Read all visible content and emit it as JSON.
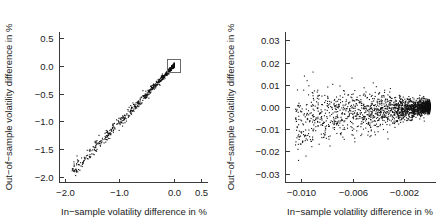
{
  "figure": {
    "background": "#ffffff",
    "point_color": "#111111",
    "axis_color": "#3a3a3a",
    "zoom_box_color": "#6b6b6b"
  },
  "chart_data": [
    {
      "id": "left-panel",
      "type": "scatter",
      "title": "",
      "xlabel": "In-sample volatility difference in %",
      "ylabel": "Out-of-sample volatility difference in %",
      "xlim": [
        -2.1,
        0.62
      ],
      "ylim": [
        -2.1,
        0.62
      ],
      "xticks": [
        -2.0,
        -1.0,
        0.0,
        0.5
      ],
      "xticklabels": [
        "-2.0",
        "-1.0",
        "0.0",
        "0.5"
      ],
      "yticks": [
        -2.0,
        -1.5,
        -1.0,
        -0.5,
        0.0,
        0.5
      ],
      "yticklabels": [
        "-2.0",
        "-1.5",
        "-1.0",
        "-0.5",
        "0.0",
        "0.5"
      ],
      "grid": false,
      "legend": null,
      "annotations": [
        {
          "kind": "zoom-rectangle",
          "x0": -0.12,
          "x1": 0.11,
          "y0": -0.12,
          "y1": 0.12,
          "note": "region magnified in right panel"
        }
      ],
      "marker": {
        "shape": "dot",
        "size_px": 1.1
      },
      "n_points": 700,
      "description": "Near-linear positive band from about (-1.85,-1.95) to (0.0,0.0), widening scatter at the lower-left tail and condensing into a dense black cluster at the origin.",
      "series": [
        {
          "name": "portfolios",
          "slope": 1.02,
          "intercept": 0.02,
          "residual_sd": 0.065,
          "x_range": [
            -1.88,
            0.0
          ],
          "x_density": "exponential-concentrated-near-zero"
        }
      ]
    },
    {
      "id": "right-panel",
      "type": "scatter",
      "title": "",
      "xlabel": "In-sample volatility difference in %",
      "ylabel": "Out-of-sample volatility difference in %",
      "xlim": [
        -0.0112,
        0.0004
      ],
      "ylim": [
        -0.034,
        0.034
      ],
      "xticks": [
        -0.01,
        -0.006,
        -0.002
      ],
      "xticklabels": [
        "-0.010",
        "-0.006",
        "-0.002"
      ],
      "yticks": [
        -0.03,
        -0.02,
        -0.01,
        0.0,
        0.01,
        0.02,
        0.03
      ],
      "yticklabels": [
        "-0.03",
        "-0.02",
        "-0.01",
        "0.00",
        "0.01",
        "0.02",
        "0.03"
      ],
      "grid": false,
      "legend": null,
      "annotations": [],
      "marker": {
        "shape": "dot",
        "size_px": 1.1
      },
      "n_points": 2200,
      "description": "Magnified view of the origin cluster: a comet-shaped cloud with a very dense blob near x = 0 and a diffuse tail spreading left to x = -0.010, vertical spread widening from about +/-0.002 at the blob to +/-0.02 at the tail.",
      "series": [
        {
          "name": "portfolios-zoom",
          "slope": 0.55,
          "intercept": 0.0005,
          "residual_sd_at_origin": 0.0012,
          "residual_sd_at_tail": 0.0075,
          "x_range": [
            -0.0105,
            -0.0001
          ],
          "x_density": "exponential-concentrated-near-zero"
        }
      ]
    }
  ]
}
